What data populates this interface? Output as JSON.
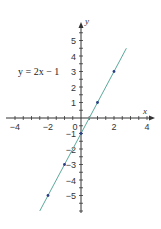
{
  "chart_data": {
    "type": "line",
    "title": "",
    "annotation": "y = 2x − 1",
    "xlabel": "x",
    "ylabel": "y",
    "xlim": [
      -4,
      4
    ],
    "ylim": [
      -6,
      6
    ],
    "x_tick_labels": [
      "−4",
      "−2",
      "0",
      "2",
      "4"
    ],
    "y_tick_labels": [
      "5",
      "4",
      "3",
      "2",
      "1",
      "−1",
      "−2",
      "−3",
      "−4",
      "−5"
    ],
    "grid": false,
    "series": [
      {
        "name": "y = 2x − 1",
        "line_x": [
          -2.5,
          2.75
        ],
        "line_y": [
          -6,
          4.5
        ],
        "points": [
          {
            "x": -2,
            "y": -5
          },
          {
            "x": -1,
            "y": -3
          },
          {
            "x": 0,
            "y": -1
          },
          {
            "x": 1,
            "y": 1
          },
          {
            "x": 2,
            "y": 3
          }
        ]
      }
    ],
    "colors": {
      "line": "#5aa99a",
      "points": "#2a3f86",
      "axes": "#333333"
    }
  }
}
